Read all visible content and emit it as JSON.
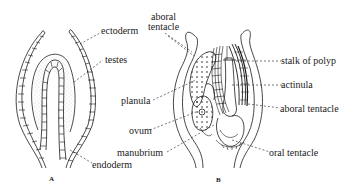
{
  "figure": {
    "panels": [
      {
        "id": "A",
        "caption": "A",
        "labels": {
          "ectoderm": "ectoderm",
          "testes": "testes",
          "endoderm": "endoderm"
        }
      },
      {
        "id": "B",
        "caption": "B",
        "labels": {
          "aboral_tentacle_top": "aboral tentacle",
          "planula": "planula",
          "ovum": "ovum",
          "manubrium": "manubrium",
          "stalk_of_polyp": "stalk of polyp",
          "actinula": "actinula",
          "aboral_tentacle_right": "aboral tentacle",
          "oral_tentacle": "oral tentacle"
        }
      }
    ],
    "colors": {
      "ink": "#1a1a1a",
      "background": "#ffffff"
    }
  }
}
